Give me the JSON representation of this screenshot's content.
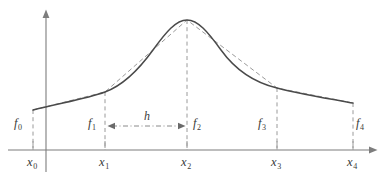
{
  "figure": {
    "type": "math-diagram",
    "colors": {
      "curve": "#4a4a4a",
      "chord": "#9a9a9a",
      "axis": "#7d7d7d",
      "dashed_drop": "#9a9a9a",
      "label_text": "#3a3a3a",
      "background": "#ffffff"
    },
    "axes": {
      "x_axis_y": 150,
      "y_axis_x": 46,
      "x_axis_start": 8,
      "x_axis_end": 375,
      "y_axis_top": 10,
      "y_axis_bottom": 172,
      "arrow_heads": [
        "x-axis-right",
        "y-axis-up"
      ]
    },
    "x_labels": [
      {
        "name": "x0",
        "base": "x",
        "sub": "0",
        "x": 33,
        "label_x": 27,
        "label_y": 160
      },
      {
        "name": "x1",
        "base": "x",
        "sub": "1",
        "x": 105,
        "label_x": 99,
        "label_y": 160
      },
      {
        "name": "x2",
        "base": "x",
        "sub": "2",
        "x": 187,
        "label_x": 181,
        "label_y": 160
      },
      {
        "name": "x3",
        "base": "x",
        "sub": "3",
        "x": 277,
        "label_x": 271,
        "label_y": 160
      },
      {
        "name": "x4",
        "base": "x",
        "sub": "4",
        "x": 353,
        "label_x": 347,
        "label_y": 160
      }
    ],
    "f_labels": [
      {
        "name": "f0",
        "base": "f",
        "sub": "0",
        "label_x": 14,
        "label_y": 117
      },
      {
        "name": "f1",
        "base": "f",
        "sub": "1",
        "label_x": 88,
        "label_y": 117
      },
      {
        "name": "f2",
        "base": "f",
        "sub": "2",
        "label_x": 193,
        "label_y": 117
      },
      {
        "name": "f3",
        "base": "f",
        "sub": "3",
        "label_x": 258,
        "label_y": 117
      },
      {
        "name": "f4",
        "base": "f",
        "sub": "4",
        "label_x": 356,
        "label_y": 117
      }
    ],
    "h_measure": {
      "label": "h",
      "label_x": 144,
      "label_y": 110,
      "arrow_y": 126,
      "arrow_x_start": 108,
      "arrow_x_end": 185
    }
  },
  "chart_data": {
    "type": "line",
    "title": "",
    "xlabel": "",
    "ylabel": "",
    "grid": false,
    "legend": null,
    "x_tick_labels": [
      "x₀",
      "x₁",
      "x₂",
      "x₃",
      "x₄"
    ],
    "y_tick_labels": [],
    "annotations": [
      "h"
    ],
    "node_count": 5,
    "nodes": [
      {
        "x_label": "x0",
        "f_label": "f0",
        "px": 33,
        "py": 110
      },
      {
        "x_label": "x1",
        "f_label": "f1",
        "px": 105,
        "py": 92
      },
      {
        "x_label": "x2",
        "f_label": "f2",
        "px": 187,
        "py": 20
      },
      {
        "x_label": "x3",
        "f_label": "f3",
        "px": 277,
        "py": 88
      },
      {
        "x_label": "x4",
        "f_label": "f4",
        "px": 353,
        "py": 103
      }
    ],
    "series": [
      {
        "name": "smooth-curve",
        "style": "solid",
        "path": "M 33 110 C 60 103, 86 99, 105 92 C 124 85, 140 68, 153 50 C 166 32, 176 20, 187 20 C 198 20, 208 32, 221 50 C 234 68, 252 82, 277 88 C 300 94, 330 99, 353 103"
      },
      {
        "name": "piecewise-linear-chords",
        "style": "dashed",
        "path": "M 33 110 L 105 92 L 187 20 L 277 88 L 353 103"
      }
    ]
  }
}
